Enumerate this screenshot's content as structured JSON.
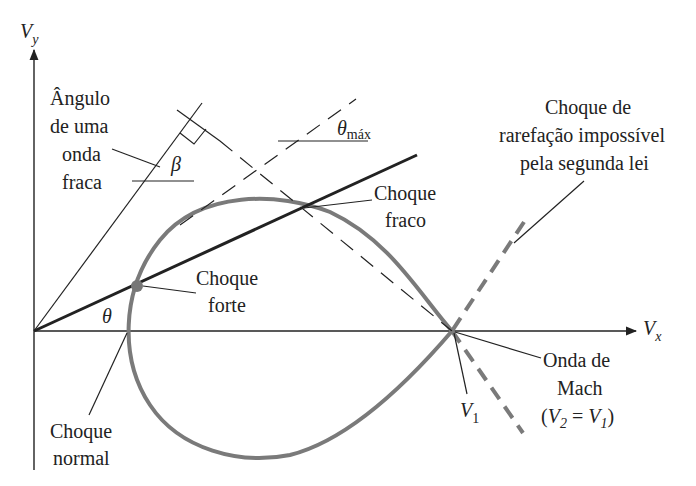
{
  "axes": {
    "x_label": "V",
    "x_sub": "x",
    "y_label": "V",
    "y_sub": "y"
  },
  "labels": {
    "weak_wave_angle": [
      "Ângulo",
      "de uma",
      "onda",
      "fraca"
    ],
    "beta": "β",
    "theta_max": "θ",
    "theta_max_sub": "máx",
    "theta": "θ",
    "weak_shock": [
      "Choque",
      "fraco"
    ],
    "strong_shock": [
      "Choque",
      "forte"
    ],
    "normal_shock": [
      "Choque",
      "normal"
    ],
    "rarefaction": [
      "Choque de",
      "rarefação impossível",
      "pela segunda lei"
    ],
    "mach_wave": [
      "Onda de",
      "Mach"
    ],
    "mach_eq_open": "(V",
    "mach_eq_sub2": "2",
    "mach_eq_mid": " = V",
    "mach_eq_sub1": "1",
    "mach_eq_close": ")",
    "v1": "V",
    "v1_sub": "1"
  },
  "colors": {
    "line": "#222222",
    "curve": "#7a7a7a",
    "dashed_gray": "#7a7a7a"
  }
}
